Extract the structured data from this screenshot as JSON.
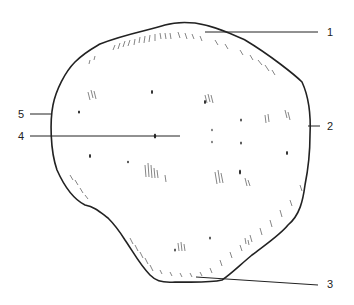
{
  "figure": {
    "type": "anatomical line drawing",
    "labels": [
      {
        "id": "1",
        "text": "1",
        "x": 327,
        "y": 26
      },
      {
        "id": "2",
        "text": "2",
        "x": 327,
        "y": 120
      },
      {
        "id": "3",
        "text": "3",
        "x": 327,
        "y": 278
      },
      {
        "id": "4",
        "text": "4",
        "x": 18,
        "y": 130
      },
      {
        "id": "5",
        "text": "5",
        "x": 18,
        "y": 108
      }
    ],
    "colors": {
      "ink": "#222222",
      "background": "#ffffff"
    }
  }
}
